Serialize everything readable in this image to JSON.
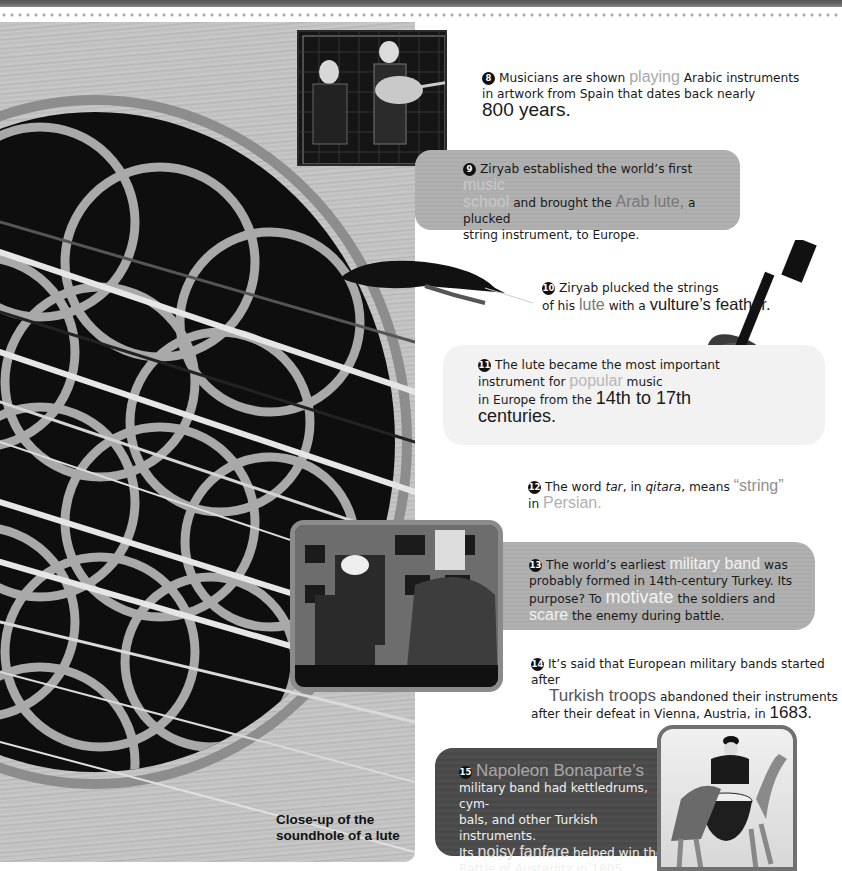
{
  "header": {
    "band": "top-decorative-band",
    "dots": "dotted-divider"
  },
  "images": {
    "musicians": "Medieval painting of musicians playing Arabic lute",
    "feather": "Vulture feather",
    "lute": "Lute instrument",
    "military_band": "Turkish military band photo",
    "camel": "Kettledrum player on camel",
    "soundhole": "Close-up of lute soundhole"
  },
  "caption": {
    "line1": "Close-up of the",
    "line2": "soundhole of a lute"
  },
  "facts": [
    {
      "num": "8",
      "t1": "Musicians are shown",
      "h1": "playing",
      "t2": "Arabic instruments",
      "t3": "in artwork from Spain that dates back nearly",
      "big": "800 years."
    },
    {
      "num": "9",
      "t1": "Ziryab established the world’s first",
      "h1": "music",
      "h2": "school",
      "t2": "and brought the",
      "h3": "Arab lute,",
      "t3": "a plucked",
      "t4": "string instrument, to Europe."
    },
    {
      "num": "10",
      "t1": "Ziryab plucked the strings",
      "t2": "of his",
      "h1": "lute",
      "t3": "with a",
      "big": "vulture’s feather."
    },
    {
      "num": "11",
      "t1": "The lute became the most important",
      "t2": "instrument for",
      "h1": "popular",
      "t3": "music",
      "t4": "in Europe from the",
      "big1": "14th to 17th",
      "big2": "centuries."
    },
    {
      "num": "12",
      "t1": "The word",
      "i1": "tar",
      "t2": ", in",
      "i2": "qitara",
      "t3": ", means",
      "h1": "“string”",
      "t4": "in",
      "h2": "Persian."
    },
    {
      "num": "13",
      "t1": "The world’s earliest",
      "h1": "military band",
      "t2": "was",
      "t3": "probably formed in 14th-century Turkey. Its",
      "t4": "purpose? To",
      "h2": "motivate",
      "t5": "the soldiers and",
      "h3": "scare",
      "t6": "the enemy during battle."
    },
    {
      "num": "14",
      "t1": "It’s said that European military bands started after",
      "h1": "Turkish troops",
      "t2": "abandoned their instruments",
      "t3": "after their defeat in Vienna, Austria, in",
      "big": "1683."
    },
    {
      "num": "15",
      "h1": "Napoleon Bonaparte’s",
      "t1": "military band had kettledrums, cym-",
      "t2": "bals, and other Turkish instruments.",
      "t3": "Its",
      "h2": "noisy fanfare",
      "t4": "helped win the",
      "t5": "Battle of Austerlitz in 1805."
    }
  ],
  "colors": {
    "highlight_grey": "#a8a8a8",
    "box_grey": "#adadad",
    "box_dark": "#4a4a4a",
    "box_light": "#f2f2f2"
  }
}
